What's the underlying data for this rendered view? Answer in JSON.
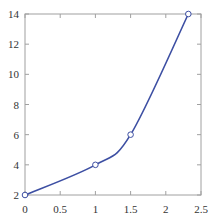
{
  "chart_data": {
    "type": "line",
    "title": "",
    "xlabel": "",
    "ylabel": "",
    "xlim": [
      0,
      2.5
    ],
    "ylim": [
      2,
      14
    ],
    "x_ticks": [
      "0",
      "0.5",
      "1",
      "1.5",
      "2",
      "2.5"
    ],
    "y_ticks": [
      "2",
      "4",
      "6",
      "8",
      "10",
      "12",
      "14"
    ],
    "grid": false,
    "legend": null,
    "series": [
      {
        "name": "curve",
        "color": "#3d4fa3",
        "markers": [
          {
            "x": 0,
            "y": 2
          },
          {
            "x": 1,
            "y": 4
          },
          {
            "x": 1.5,
            "y": 6
          },
          {
            "x": 2.32,
            "y": 14
          }
        ]
      }
    ]
  },
  "colors": {
    "line": "#3d4fa3",
    "axis": "#999999",
    "marker_fill": "#ffffff"
  }
}
